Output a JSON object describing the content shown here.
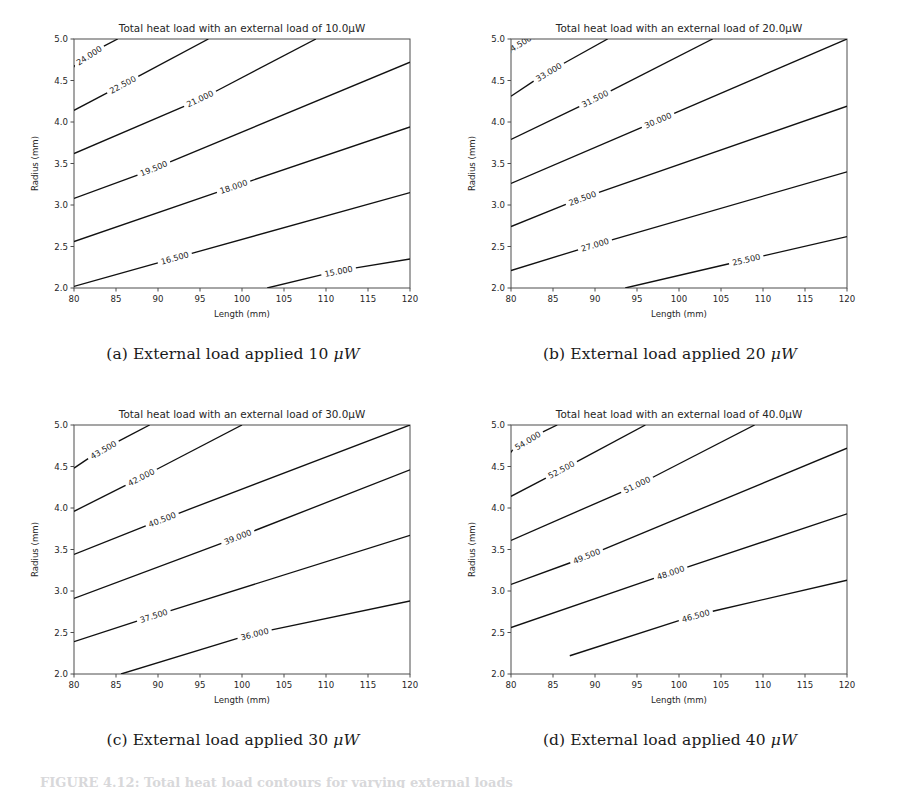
{
  "figure": {
    "caption_clipped": "FIGURE 4.12: Total heat load contours for varying external loads",
    "panel_count": 4
  },
  "axes_common": {
    "xlabel": "Length (mm)",
    "ylabel": "Radius (mm)",
    "xticks": [
      "80",
      "85",
      "90",
      "95",
      "100",
      "105",
      "110",
      "115",
      "120"
    ],
    "yticks": [
      "2.0",
      "2.5",
      "3.0",
      "3.5",
      "4.0",
      "4.5",
      "5.0"
    ],
    "xlim": [
      80,
      120
    ],
    "ylim": [
      2.0,
      5.0
    ],
    "grid": false,
    "line_color": "#111111",
    "axis_color": "#4d4d4d"
  },
  "panels": [
    {
      "id": "a",
      "title": "Total heat load with an external load of 10.0μW",
      "caption_prefix": "(a) External load applied 10 ",
      "caption_unit": "μW",
      "external_load": 10.0
    },
    {
      "id": "b",
      "title": "Total heat load with an external load of 20.0μW",
      "caption_prefix": "(b) External load applied 20 ",
      "caption_unit": "μW",
      "external_load": 20.0
    },
    {
      "id": "c",
      "title": "Total heat load with an external load of 30.0μW",
      "caption_prefix": "(c) External load applied 30 ",
      "caption_unit": "μW",
      "external_load": 30.0
    },
    {
      "id": "d",
      "title": "Total heat load with an external load of 40.0μW",
      "caption_prefix": "(d) External load applied 40 ",
      "caption_unit": "μW",
      "external_load": 40.0
    }
  ],
  "chart_data": [
    {
      "type": "line",
      "panel": "a",
      "title": "Total heat load with an external load of 10.0μW",
      "xlabel": "Length (mm)",
      "ylabel": "Radius (mm)",
      "xlim": [
        80,
        120
      ],
      "ylim": [
        2.0,
        5.0
      ],
      "grid": false,
      "contour_levels": [
        15.0,
        16.5,
        18.0,
        19.5,
        21.0,
        22.5,
        24.0
      ],
      "contours": [
        {
          "level": "15.000",
          "points": [
            [
              103.0,
              2.0
            ],
            [
              120.0,
              2.35
            ]
          ],
          "label_x": 111.5,
          "label_y": 2.2
        },
        {
          "level": "16.500",
          "points": [
            [
              80.0,
              2.02
            ],
            [
              120.0,
              3.15
            ]
          ],
          "label_x": 92.0,
          "label_y": 2.36
        },
        {
          "level": "18.000",
          "points": [
            [
              80.0,
              2.56
            ],
            [
              120.0,
              3.94
            ]
          ],
          "label_x": 99.0,
          "label_y": 3.22
        },
        {
          "level": "19.500",
          "points": [
            [
              80.0,
              3.08
            ],
            [
              120.0,
              4.72
            ]
          ],
          "label_x": 89.5,
          "label_y": 3.44
        },
        {
          "level": "21.000",
          "points": [
            [
              80.0,
              3.62
            ],
            [
              108.8,
              5.0
            ]
          ],
          "label_x": 95.0,
          "label_y": 4.28
        },
        {
          "level": "22.500",
          "points": [
            [
              80.0,
              4.14
            ],
            [
              96.0,
              5.0
            ]
          ],
          "label_x": 85.8,
          "label_y": 4.45
        },
        {
          "level": "24.000",
          "points": [
            [
              80.0,
              4.66
            ],
            [
              85.2,
              5.0
            ]
          ],
          "label_x": 81.8,
          "label_y": 4.8
        }
      ]
    },
    {
      "type": "line",
      "panel": "b",
      "title": "Total heat load with an external load of 20.0μW",
      "xlabel": "Length (mm)",
      "ylabel": "Radius (mm)",
      "xlim": [
        80,
        120
      ],
      "ylim": [
        2.0,
        5.0
      ],
      "grid": false,
      "contour_levels": [
        25.5,
        27.0,
        28.5,
        30.0,
        31.5,
        33.0,
        34.5
      ],
      "contours": [
        {
          "level": "25.500",
          "points": [
            [
              93.6,
              2.0
            ],
            [
              120.0,
              2.62
            ]
          ],
          "label_x": 108.0,
          "label_y": 2.34
        },
        {
          "level": "27.000",
          "points": [
            [
              80.0,
              2.21
            ],
            [
              120.0,
              3.4
            ]
          ],
          "label_x": 90.0,
          "label_y": 2.52
        },
        {
          "level": "28.500",
          "points": [
            [
              80.0,
              2.74
            ],
            [
              120.0,
              4.19
            ]
          ],
          "label_x": 88.5,
          "label_y": 3.08
        },
        {
          "level": "30.000",
          "points": [
            [
              80.0,
              3.26
            ],
            [
              120.0,
              5.0
            ]
          ],
          "label_x": 97.5,
          "label_y": 4.02
        },
        {
          "level": "31.500",
          "points": [
            [
              80.0,
              3.79
            ],
            [
              104.0,
              5.0
            ]
          ],
          "label_x": 90.0,
          "label_y": 4.28
        },
        {
          "level": "33.000",
          "points": [
            [
              80.0,
              4.31
            ],
            [
              91.5,
              5.0
            ]
          ],
          "label_x": 84.5,
          "label_y": 4.6
        },
        {
          "level": "34.500",
          "points": [
            [
              80.0,
              4.83
            ],
            [
              82.8,
              5.0
            ]
          ],
          "label_x": 80.9,
          "label_y": 4.93
        }
      ]
    },
    {
      "type": "line",
      "panel": "c",
      "title": "Total heat load with an external load of 30.0μW",
      "xlabel": "Length (mm)",
      "ylabel": "Radius (mm)",
      "xlim": [
        80,
        120
      ],
      "ylim": [
        2.0,
        5.0
      ],
      "grid": false,
      "contour_levels": [
        36.0,
        37.5,
        39.0,
        40.5,
        42.0,
        43.5
      ],
      "contours": [
        {
          "level": "36.000",
          "points": [
            [
              85.6,
              2.0
            ],
            [
              120.0,
              2.88
            ]
          ],
          "label_x": 101.5,
          "label_y": 2.48
        },
        {
          "level": "37.500",
          "points": [
            [
              80.0,
              2.39
            ],
            [
              120.0,
              3.67
            ]
          ],
          "label_x": 89.5,
          "label_y": 2.7
        },
        {
          "level": "39.000",
          "points": [
            [
              80.0,
              2.91
            ],
            [
              120.0,
              4.46
            ]
          ],
          "label_x": 99.5,
          "label_y": 3.65
        },
        {
          "level": "40.500",
          "points": [
            [
              80.0,
              3.44
            ],
            [
              120.0,
              5.0
            ]
          ],
          "label_x": 90.5,
          "label_y": 3.86
        },
        {
          "level": "42.000",
          "points": [
            [
              80.0,
              3.96
            ],
            [
              100.0,
              5.0
            ]
          ],
          "label_x": 88.0,
          "label_y": 4.37
        },
        {
          "level": "43.500",
          "points": [
            [
              80.0,
              4.48
            ],
            [
              89.0,
              5.0
            ]
          ],
          "label_x": 83.5,
          "label_y": 4.7
        }
      ]
    },
    {
      "type": "line",
      "panel": "d",
      "title": "Total heat load with an external load of 40.0μW",
      "xlabel": "Length (mm)",
      "ylabel": "Radius (mm)",
      "xlim": [
        80,
        120
      ],
      "ylim": [
        2.0,
        5.0
      ],
      "grid": false,
      "contour_levels": [
        46.5,
        48.0,
        49.5,
        51.0,
        52.5,
        54.0
      ],
      "contours": [
        {
          "level": "46.500",
          "points": [
            [
              87.0,
              2.22
            ],
            [
              120.0,
              3.13
            ]
          ],
          "label_x": 102.0,
          "label_y": 2.7
        },
        {
          "level": "48.000",
          "points": [
            [
              80.0,
              2.56
            ],
            [
              120.0,
              3.93
            ]
          ],
          "label_x": 99.0,
          "label_y": 3.22
        },
        {
          "level": "49.500",
          "points": [
            [
              80.0,
              3.08
            ],
            [
              120.0,
              4.72
            ]
          ],
          "label_x": 89.0,
          "label_y": 3.42
        },
        {
          "level": "51.000",
          "points": [
            [
              80.0,
              3.61
            ],
            [
              109.0,
              5.0
            ]
          ],
          "label_x": 95.0,
          "label_y": 4.28
        },
        {
          "level": "52.500",
          "points": [
            [
              80.0,
              4.14
            ],
            [
              96.0,
              5.0
            ]
          ],
          "label_x": 86.0,
          "label_y": 4.46
        },
        {
          "level": "54.000",
          "points": [
            [
              80.0,
              4.67
            ],
            [
              85.5,
              5.0
            ]
          ],
          "label_x": 82.0,
          "label_y": 4.81
        }
      ]
    }
  ]
}
